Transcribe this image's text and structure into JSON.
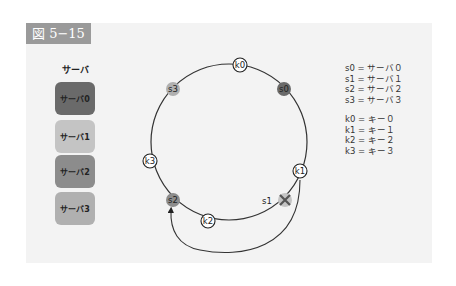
{
  "figure": {
    "label": "図 5−15"
  },
  "servers_legend": {
    "title": "サーバ",
    "items": [
      {
        "label": "サーバ0",
        "color": "#6a6a6a"
      },
      {
        "label": "サーバ1",
        "color": "#c4c4c4"
      },
      {
        "label": "サーバ2",
        "color": "#8c8c8c"
      },
      {
        "label": "サーバ3",
        "color": "#b0b0b0"
      }
    ]
  },
  "definitions": {
    "servers": [
      "s0 = サーバ０",
      "s1 = サーバ１",
      "s2 = サーバ２",
      "s3 = サーバ３"
    ],
    "keys": [
      "k0 = キー０",
      "k1 = キー１",
      "k2 = キー２",
      "k3 = キー３"
    ]
  },
  "ring": {
    "servers": [
      {
        "id": "s0",
        "label": "s0",
        "color": "#6a6a6a"
      },
      {
        "id": "s1",
        "label": "s1",
        "color": "#c4c4c4",
        "removed": true
      },
      {
        "id": "s2",
        "label": "s2",
        "color": "#8c8c8c"
      },
      {
        "id": "s3",
        "label": "s3",
        "color": "#b0b0b0"
      }
    ],
    "keys": [
      {
        "id": "k0",
        "label": "k0"
      },
      {
        "id": "k1",
        "label": "k1"
      },
      {
        "id": "k2",
        "label": "k2"
      },
      {
        "id": "k3",
        "label": "k3"
      }
    ],
    "remap_arrow": {
      "from": "k1",
      "to": "s2"
    }
  }
}
